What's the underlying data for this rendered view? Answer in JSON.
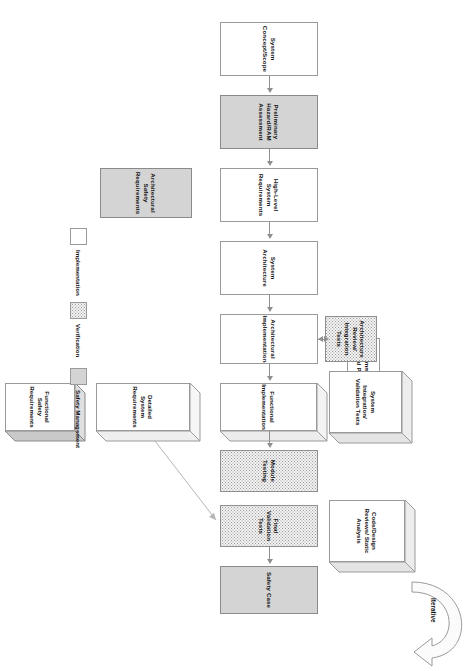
{
  "diagram": {
    "title": "",
    "iterative_label": "Iterative",
    "nodes": {
      "system_concept_scope": "System Concept/Scope",
      "preliminary_hazard": "Preliminary Hazard/RAM Assessment",
      "high_level_system_requirements": "High-Level System Requirements",
      "system_architecture": "System Architecture",
      "architectural_implementation": "Architectural Implementation",
      "functional_implementation": "Functional Implementation",
      "module_testing": "Module Testing",
      "final_validation_tests": "Final Validation Tests",
      "safety_case": "Safety Case",
      "architectural_safety_requirements": "Architectural Safety Requirements",
      "functional_safety_requirements": "Functional Safety Requirements",
      "detailed_system_requirements": "Detailed System Requirements",
      "common_tactical_policies": "Common Tactical Policies",
      "architecture_review": "Architecture Review/ Integration Tests",
      "system_integration": "System Integration/ Validation Tests",
      "code_design_reviews": "Code/Design Reviews/ Static Analysis"
    }
  },
  "legend": {
    "items": [
      {
        "label": "Implementation",
        "fill": "#ffffff",
        "style": "plain"
      },
      {
        "label": "Verification",
        "fill": "#f2f2f2",
        "style": "dotted"
      },
      {
        "label": "Safety Management",
        "fill": "#d4d4d4",
        "style": "solid-gray"
      }
    ]
  },
  "colors": {
    "stroke": "#9a9a9a",
    "arrow": "#8f8f8f",
    "safety_fill": "#d4d4d4",
    "verification_fill": "#f2f2f2",
    "implementation_fill": "#ffffff",
    "text": "#111111"
  }
}
